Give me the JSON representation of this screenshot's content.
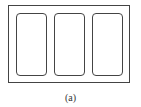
{
  "diagram": {
    "caption": "(a)",
    "outer_frame": {
      "x": 8,
      "y": 5,
      "w": 122,
      "h": 78
    },
    "panels": [
      {
        "id": "left",
        "x": 16
      },
      {
        "id": "middle",
        "x": 54
      },
      {
        "id": "right",
        "x": 92
      }
    ],
    "stroke_color": "#444444"
  }
}
